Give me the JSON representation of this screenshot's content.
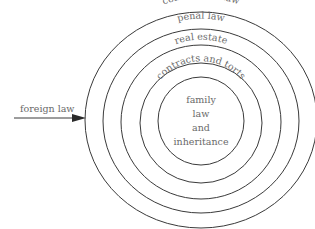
{
  "diagram": {
    "type": "concentric-rings",
    "rings": [
      {
        "label": "commercial law",
        "rx": 116,
        "ry": 108
      },
      {
        "label": "penal law",
        "rx": 98,
        "ry": 92
      },
      {
        "label": "real estate",
        "rx": 80,
        "ry": 77
      },
      {
        "label": "contracts and torts",
        "rx": 61,
        "ry": 60
      },
      {
        "label": "family law and inheritance",
        "rx": 43,
        "ry": 44
      }
    ],
    "core_lines": [
      "family",
      "law",
      "and",
      "inheritance"
    ],
    "arrow": {
      "label": "foreign law"
    }
  }
}
